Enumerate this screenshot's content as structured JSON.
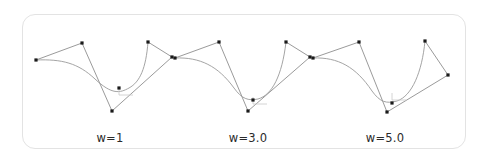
{
  "figure": {
    "background_color": "#ffffff",
    "card": {
      "border_color": "#e3e3e3",
      "radius_px": 13,
      "x": 22,
      "y": 14,
      "width": 444,
      "height": 135
    },
    "style": {
      "curve_color": "#9a9a9a",
      "hull_color": "#6f6f6f",
      "point_color": "#1a1a1a",
      "marker_color": "#c9c9c9",
      "label_color": "#2b2b2b"
    }
  },
  "chart_data": {
    "type": "line",
    "title": "",
    "xlabel": "",
    "ylabel": "",
    "grid": false,
    "legend": false,
    "panels": [
      {
        "label": "w=1",
        "weight": 1,
        "label_x": 110,
        "label_y": 131,
        "control_points": [
          {
            "x": 36,
            "y": 60
          },
          {
            "x": 82,
            "y": 43
          },
          {
            "x": 112,
            "y": 111
          },
          {
            "x": 119,
            "y": 88
          },
          {
            "x": 148,
            "y": 42
          },
          {
            "x": 172,
            "y": 57
          }
        ],
        "hull_path": "M36,60 L82,43 L112,111 L172,57 L148,42",
        "curve_path": "M36,60 C62,59 78,63 95,79 C112,95 120,93 129,88 C140,82 146,68 148,42",
        "marker_corner": {
          "x": 119,
          "y": 88,
          "w": 14,
          "h": 7
        }
      },
      {
        "label": "w=3.0",
        "weight": 3.0,
        "label_x": 248,
        "label_y": 131,
        "control_points": [
          {
            "x": 175,
            "y": 58
          },
          {
            "x": 219,
            "y": 42
          },
          {
            "x": 248,
            "y": 111
          },
          {
            "x": 253,
            "y": 100
          },
          {
            "x": 286,
            "y": 42
          },
          {
            "x": 310,
            "y": 57
          }
        ],
        "hull_path": "M175,58 L219,42 L248,111 L310,57 L286,42",
        "curve_path": "M175,58 C200,57 218,66 234,88 C242,99 248,101 258,99 C272,95 282,76 286,42",
        "marker_corner": {
          "x": 253,
          "y": 97,
          "w": 14,
          "h": 7
        }
      },
      {
        "label": "w=5.0",
        "weight": 5.0,
        "label_x": 385,
        "label_y": 131,
        "control_points": [
          {
            "x": 313,
            "y": 58
          },
          {
            "x": 359,
            "y": 42
          },
          {
            "x": 387,
            "y": 112
          },
          {
            "x": 392,
            "y": 103
          },
          {
            "x": 425,
            "y": 41
          },
          {
            "x": 448,
            "y": 75
          }
        ],
        "hull_path": "M313,58 L359,42 L387,112 L448,75 L425,41",
        "curve_path": "M313,58 C338,57 356,67 372,91 C380,102 386,104 397,101 C412,96 422,72 425,41",
        "marker_corner": {
          "x": 392,
          "y": 93,
          "w": 14,
          "h": 7
        }
      }
    ]
  }
}
